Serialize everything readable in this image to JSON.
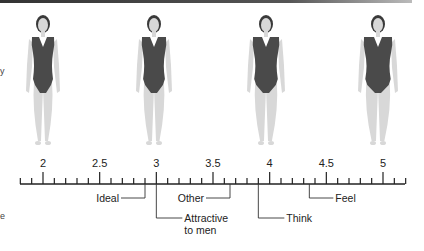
{
  "figure": {
    "silhouettes": [
      {
        "label": "figure-2",
        "scale_value": 2,
        "x_center": 43
      },
      {
        "label": "figure-3",
        "scale_value": 3,
        "x_center": 154
      },
      {
        "label": "figure-4",
        "scale_value": 4,
        "x_center": 266
      },
      {
        "label": "figure-5",
        "scale_value": 5,
        "x_center": 378
      }
    ],
    "axis": {
      "min": 1.8,
      "max": 5.2,
      "minor_step": 0.1,
      "major_labels": [
        "2",
        "2.5",
        "3",
        "3.5",
        "4",
        "4.5",
        "5"
      ],
      "major_values": [
        2,
        2.5,
        3,
        3.5,
        4,
        4.5,
        5
      ]
    },
    "callouts": [
      {
        "label": "Ideal",
        "value": 2.9,
        "side": "left",
        "level": 1
      },
      {
        "label": "Attractive to men",
        "line1": "Attractive",
        "line2": "to men",
        "value": 3.0,
        "side": "right",
        "level": 2
      },
      {
        "label": "Other",
        "value": 3.65,
        "side": "left",
        "level": 1
      },
      {
        "label": "Think",
        "value": 3.9,
        "side": "right",
        "level": 2
      },
      {
        "label": "Feel",
        "value": 4.35,
        "side": "right",
        "level": 1
      }
    ],
    "colors": {
      "swimsuit": "#4a4a4a",
      "skin": "#d8d8d8",
      "hair": "#3a3a3a",
      "axis": "#222222"
    }
  },
  "edge_marks": {
    "left_top": "y",
    "left_bottom": "e"
  }
}
